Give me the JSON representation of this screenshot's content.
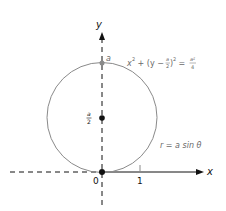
{
  "diagram": {
    "axes": {
      "x_label": "x",
      "y_label": "y",
      "origin_label": "0",
      "tick_label": "1"
    },
    "points": {
      "top_label": "a",
      "center_label_num": "a",
      "center_label_den": "2"
    },
    "equations": {
      "cartesian_lhs": "x",
      "cartesian_sup1": "2",
      "cartesian_mid": " + (y − ",
      "cartesian_frac_num": "a",
      "cartesian_frac_den": "2",
      "cartesian_close": ")",
      "cartesian_sup2": "2",
      "cartesian_eq": " = ",
      "cartesian_rhs_num": "a²",
      "cartesian_rhs_den": "4",
      "polar": "r = a sin θ"
    },
    "colors": {
      "circle": "#8a8a8a",
      "axis": "#111111",
      "label_gray": "#6a6a6a",
      "text_dark": "#111111"
    }
  }
}
